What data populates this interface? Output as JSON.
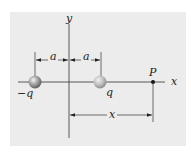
{
  "figure": {
    "background": "#ececec",
    "axis_labels": {
      "x": "x",
      "y": "y"
    },
    "charges": [
      {
        "label": "−q",
        "position": "-a"
      },
      {
        "label": "q",
        "position": "a"
      }
    ],
    "point": {
      "label": "P"
    },
    "dimensions": {
      "left_span": "a",
      "right_span": "a",
      "distance": "x"
    }
  }
}
